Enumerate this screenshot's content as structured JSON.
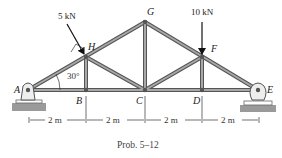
{
  "diagram": {
    "type": "truss",
    "caption": "Prob. 5–12",
    "joints": {
      "A": {
        "label": "A",
        "x": 28,
        "y": 90
      },
      "B": {
        "label": "B",
        "x": 86,
        "y": 90
      },
      "C": {
        "label": "C",
        "x": 145,
        "y": 90
      },
      "D": {
        "label": "D",
        "x": 202,
        "y": 90
      },
      "E": {
        "label": "E",
        "x": 258,
        "y": 90
      },
      "H": {
        "label": "H",
        "x": 86,
        "y": 57
      },
      "G": {
        "label": "G",
        "x": 145,
        "y": 22
      },
      "F": {
        "label": "F",
        "x": 202,
        "y": 57
      }
    },
    "members": [
      [
        "A",
        "B"
      ],
      [
        "B",
        "C"
      ],
      [
        "C",
        "D"
      ],
      [
        "D",
        "E"
      ],
      [
        "A",
        "H"
      ],
      [
        "H",
        "G"
      ],
      [
        "G",
        "F"
      ],
      [
        "F",
        "E"
      ],
      [
        "H",
        "B"
      ],
      [
        "H",
        "C"
      ],
      [
        "G",
        "C"
      ],
      [
        "F",
        "C"
      ],
      [
        "F",
        "D"
      ]
    ],
    "loads": [
      {
        "label": "5 kN",
        "joint": "H",
        "direction": "perpendicular to AG"
      },
      {
        "label": "10 kN",
        "joint": "F",
        "direction": "downward"
      }
    ],
    "angle": {
      "label": "30°",
      "at": "A"
    },
    "dimensions": [
      "2 m",
      "2 m",
      "2 m",
      "2 m"
    ],
    "supports": {
      "A": "pin",
      "E": "roller"
    },
    "colors": {
      "member": "#8a8a8a",
      "member_edge": "#555555",
      "ground": "#9a9a9a"
    }
  }
}
